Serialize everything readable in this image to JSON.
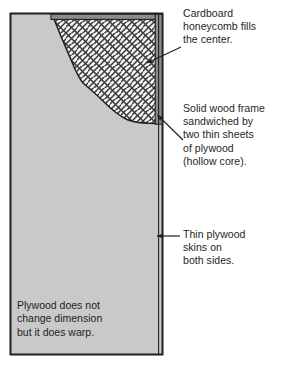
{
  "diagram": {
    "panel_note": "Plywood does not\nchange dimension\nbut it does warp.",
    "callouts": [
      {
        "id": "honeycomb",
        "text": "Cardboard\nhoneycomb fills\nthe center.",
        "leader": "diagonal-arrow-left",
        "target": "cardboard-honeycomb-core"
      },
      {
        "id": "frame",
        "text": "Solid wood frame\nsandwiched by\ntwo thin sheets\nof plywood\n(hollow core).",
        "leader": "diagonal-arrow-up-left",
        "target": "solid-wood-frame-stile"
      },
      {
        "id": "skins",
        "text": "Thin plywood\nskins on\nboth sides.",
        "leader": "horizontal-arrow-left",
        "target": "plywood-skin-right"
      }
    ],
    "regions": [
      {
        "name": "plywood-skin-face",
        "label": "Plywood face skin"
      },
      {
        "name": "solid-wood-frame-rail-top",
        "label": "Top rail"
      },
      {
        "name": "solid-wood-frame-stile-right",
        "label": "Right stile"
      },
      {
        "name": "cardboard-honeycomb-core",
        "label": "Honeycomb core"
      }
    ],
    "colors": {
      "plywood_face": "#c9c9c9",
      "frame_wood": "#8c8c8c",
      "honeycomb_fill": "#f2f2f2",
      "honeycomb_line": "#3a3a3a",
      "outline": "#231f20",
      "text": "#231f20",
      "background": "#ffffff"
    }
  }
}
